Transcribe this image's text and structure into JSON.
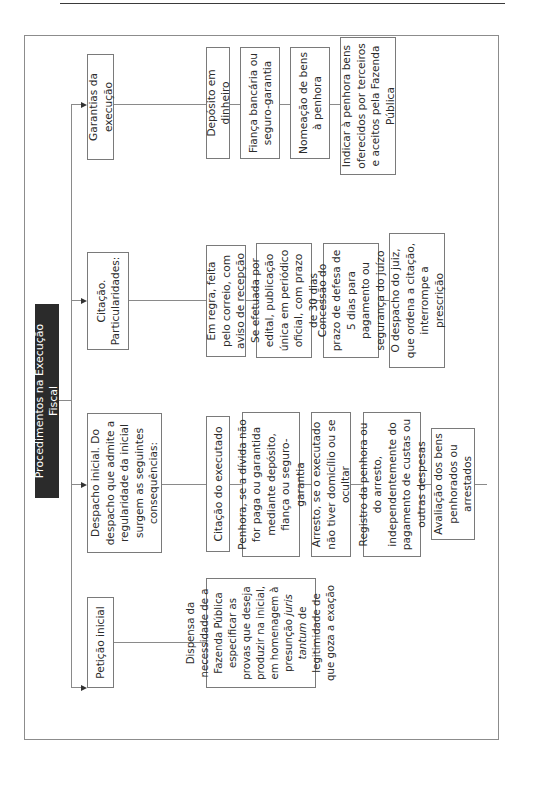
{
  "diagram": {
    "title": "Procedimentos na Execução Fiscal",
    "branches": [
      {
        "label": "Petição inicial",
        "children": [
          {
            "text_before": "Dispensa da necessidade de a Fazenda Pública especificar as provas que deseja produzir na inicial, em homenagem à presunção ",
            "text_italic": "juris tantum",
            "text_after": " de legitimidade de que goza a exação"
          }
        ]
      },
      {
        "label": "Despacho inicial. Do despacho que admite a regularidade da inicial surgem as seguintes consequências:",
        "children": [
          {
            "text": "Citação do executado"
          },
          {
            "text": "Penhora, se a dívida não for paga ou garantida mediante depósito, fiança ou seguro-garantia"
          },
          {
            "text": "Arresto, se o executado não tiver domicílio ou se ocultar"
          },
          {
            "text": "Registro da penhora ou do arresto, independentemente do pagamento de custas ou outras despesas"
          },
          {
            "text": "Avaliação dos bens penhorados ou arrestados"
          }
        ]
      },
      {
        "label": "Citação. Particularidades:",
        "children": [
          {
            "text": "Em regra, feita pelo correio, com aviso de recepção"
          },
          {
            "text": "Se efetuada por edital, publicação única em periódico oficial, com prazo de 30 dias"
          },
          {
            "text": "Concessão do prazo de defesa de 5 dias para pagamento ou segurança do juízo"
          },
          {
            "text": "O despacho do juiz, que ordena a citação, interrompe a prescrição"
          }
        ]
      },
      {
        "label": "Garantias da execução",
        "children": [
          {
            "text": "Depósito em dinheiro"
          },
          {
            "text": "Fiança bancária ou seguro-garantia"
          },
          {
            "text": "Nomeação de bens à penhora"
          },
          {
            "text": "Indicar à penhora bens oferecidos por terceiros e aceitos pela Fazenda Pública"
          }
        ]
      }
    ]
  }
}
